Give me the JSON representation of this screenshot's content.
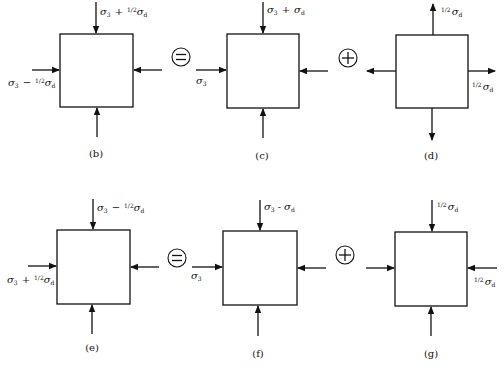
{
  "diagram": {
    "colors": {
      "ink": "#111111",
      "background": "#ffffff"
    },
    "rows": [
      {
        "equation": [
          {
            "id": "b",
            "caption": "(b)",
            "arrows": "compressive",
            "labels": {
              "top": "σ₃ + ½σ_d",
              "left": "σ₃ − ½σ_d"
            },
            "label_parts": {
              "top": {
                "sig": "σ",
                "sub": "3",
                "op": "+",
                "frac": "1/2",
                "sig2": "σ",
                "sub2": "d"
              },
              "left": {
                "sig": "σ",
                "sub": "3",
                "op": "−",
                "frac": "1/2",
                "sig2": "σ",
                "sub2": "d"
              }
            }
          },
          {
            "operator": "="
          },
          {
            "id": "c",
            "caption": "(c)",
            "arrows": "compressive",
            "labels": {
              "top": "σ₃ + σ_d",
              "left": "σ₃"
            },
            "label_parts": {
              "top": {
                "sig": "σ",
                "sub": "3",
                "op": "+",
                "sig2": "σ",
                "sub2": "d"
              },
              "left": {
                "sig": "σ",
                "sub": "3"
              }
            }
          },
          {
            "operator": "+"
          },
          {
            "id": "d",
            "caption": "(d)",
            "arrows": "tensile",
            "labels": {
              "top": "½σ_d",
              "right": "½σ_d"
            },
            "label_parts": {
              "top": {
                "frac": "1/2",
                "sig": "σ",
                "sub": "d"
              },
              "right": {
                "frac": "1/2",
                "sig": "σ",
                "sub": "d"
              }
            }
          }
        ]
      },
      {
        "equation": [
          {
            "id": "e",
            "caption": "(e)",
            "arrows": "compressive",
            "labels": {
              "top": "σ₃ − ½σ_d",
              "left": "σ₃ + ½σ_d"
            },
            "label_parts": {
              "top": {
                "sig": "σ",
                "sub": "3",
                "op": "−",
                "frac": "1/2",
                "sig2": "σ",
                "sub2": "d"
              },
              "left": {
                "sig": "σ",
                "sub": "3",
                "op": "+",
                "frac": "1/2",
                "sig2": "σ",
                "sub2": "d"
              }
            }
          },
          {
            "operator": "="
          },
          {
            "id": "f",
            "caption": "(f)",
            "arrows": "compressive",
            "labels": {
              "top": "σ₃ − σ_d",
              "left": "σ₃"
            },
            "label_parts": {
              "top": {
                "sig": "σ",
                "sub": "3",
                "op": "-",
                "sig2": "σ",
                "sub2": "d"
              },
              "left": {
                "sig": "σ",
                "sub": "3"
              }
            }
          },
          {
            "operator": "+"
          },
          {
            "id": "g",
            "caption": "(g)",
            "arrows": "compressive",
            "labels": {
              "top": "½σ_d",
              "right": "½σ_d"
            },
            "label_parts": {
              "top": {
                "frac": "1/2",
                "sig": "σ",
                "sub": "d"
              },
              "right": {
                "frac": "1/2",
                "sig": "σ",
                "sub": "d"
              }
            }
          }
        ]
      }
    ],
    "captions": [
      "(b)",
      "(c)",
      "(d)",
      "(e)",
      "(f)",
      "(g)"
    ],
    "operators": {
      "equals": "=",
      "plus": "+"
    }
  }
}
